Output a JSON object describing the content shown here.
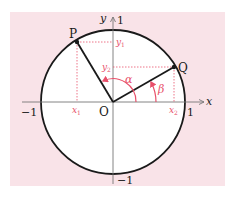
{
  "diagram": {
    "type": "unit-circle",
    "colors": {
      "background_panel": "#f9e3e8",
      "circle_fill": "#ffffff",
      "circle_stroke": "#1a1a1a",
      "axes": "#777777",
      "accent": "#e8506a",
      "guides": "#e8506a"
    },
    "axes": {
      "x_label": "x",
      "y_label": "y",
      "x_pos_tick": "1",
      "x_neg_tick": "−1",
      "y_pos_tick": "1",
      "y_neg_tick": "−1",
      "origin_label": "O"
    },
    "points": {
      "P": {
        "label": "P",
        "x_coord_label": "x",
        "x_sub": "1",
        "y_coord_label": "y",
        "y_sub": "1"
      },
      "Q": {
        "label": "Q",
        "x_coord_label": "x",
        "x_sub": "2",
        "y_coord_label": "y",
        "y_sub": "2"
      }
    },
    "angles": {
      "alpha": "α",
      "beta": "β"
    }
  }
}
